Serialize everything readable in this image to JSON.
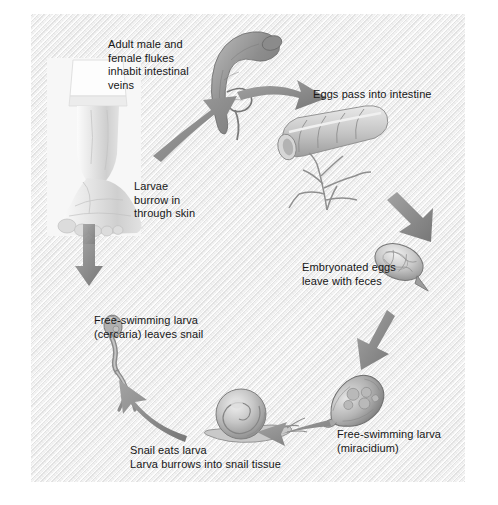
{
  "figure": {
    "background_color": "#f3f3f3",
    "text_color": "#161616",
    "arrow_color": "#8a8a8a",
    "art_color": "#9a9a9a"
  },
  "labels": {
    "adult_flukes": "Adult male and\nfemale flukes\ninhabit intestinal\nveins",
    "eggs_intestine": "Eggs pass into intestine",
    "embryonated_eggs": "Embryonated eggs\nleave with feces",
    "miracidium": "Free-swimming larva\n(miracidium)",
    "snail": "Snail eats larva\nLarva burrows into snail tissue",
    "cercaria": "Free-swimming larva\n(cercaria) leaves snail",
    "skin_penetration": "Larvae\nburrow in\nthrough skin"
  },
  "stages": [
    {
      "id": "adult-flukes",
      "name": "adult-fluke-pair",
      "label_key": "adult_flukes"
    },
    {
      "id": "intestine",
      "name": "intestine-illustration",
      "label_key": "eggs_intestine"
    },
    {
      "id": "embryonated-egg",
      "name": "embryonated-egg",
      "label_key": "embryonated_eggs"
    },
    {
      "id": "miracidium",
      "name": "miracidium-larva",
      "label_key": "miracidium"
    },
    {
      "id": "snail",
      "name": "snail-host",
      "label_key": "snail"
    },
    {
      "id": "cercaria",
      "name": "cercaria-larva",
      "label_key": "cercaria"
    },
    {
      "id": "human-foot",
      "name": "human-foot",
      "label_key": "skin_penetration"
    }
  ],
  "arrows": [
    {
      "name": "arrow-foot-to-adult",
      "from": "human-foot",
      "to": "adult-flukes"
    },
    {
      "name": "arrow-adult-to-intestine",
      "from": "adult-flukes",
      "to": "intestine"
    },
    {
      "name": "arrow-intestine-to-egg",
      "from": "intestine",
      "to": "embryonated-egg"
    },
    {
      "name": "arrow-egg-to-miracidium",
      "from": "embryonated-egg",
      "to": "miracidium"
    },
    {
      "name": "arrow-miracidium-to-snail",
      "from": "miracidium",
      "to": "snail"
    },
    {
      "name": "arrow-snail-to-cercaria",
      "from": "snail",
      "to": "cercaria"
    },
    {
      "name": "arrow-cercaria-to-foot",
      "from": "cercaria",
      "to": "human-foot"
    }
  ]
}
